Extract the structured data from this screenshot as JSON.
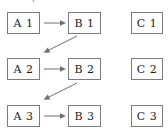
{
  "caption": {
    "text": "Example 2."
  },
  "diagram": {
    "type": "commutative-diagram",
    "style": {
      "box_border": "#7c7c7c",
      "arrow": "#6f6f6f",
      "text": "#1b1b1b",
      "background": "#ffffff"
    },
    "columns": [
      "A",
      "B",
      "C"
    ],
    "rows": [
      "1",
      "2",
      "3"
    ],
    "nodes": [
      {
        "id": "a1",
        "label": "A 1",
        "col": "A",
        "row": "1",
        "x": 7,
        "y": 12,
        "w": 33,
        "h": 22
      },
      {
        "id": "b1",
        "label": "B 1",
        "col": "B",
        "row": "1",
        "x": 68,
        "y": 12,
        "w": 33,
        "h": 22
      },
      {
        "id": "c1",
        "label": "C 1",
        "col": "C",
        "row": "1",
        "x": 131,
        "y": 12,
        "w": 32,
        "h": 22
      },
      {
        "id": "a2",
        "label": "A 2",
        "col": "A",
        "row": "2",
        "x": 7,
        "y": 58,
        "w": 33,
        "h": 22
      },
      {
        "id": "b2",
        "label": "B 2",
        "col": "B",
        "row": "2",
        "x": 68,
        "y": 58,
        "w": 33,
        "h": 22
      },
      {
        "id": "c2",
        "label": "C 2",
        "col": "C",
        "row": "2",
        "x": 131,
        "y": 58,
        "w": 32,
        "h": 22
      },
      {
        "id": "a3",
        "label": "A 3",
        "col": "A",
        "row": "3",
        "x": 7,
        "y": 105,
        "w": 33,
        "h": 22
      },
      {
        "id": "b3",
        "label": "B 3",
        "col": "B",
        "row": "3",
        "x": 68,
        "y": 105,
        "w": 33,
        "h": 22
      },
      {
        "id": "c3",
        "label": "C 3",
        "col": "C",
        "row": "3",
        "x": 131,
        "y": 105,
        "w": 32,
        "h": 22
      }
    ],
    "edges": [
      {
        "id": "e-a1-b1",
        "from": "a1",
        "to": "b1",
        "kind": "horizontal",
        "label": ""
      },
      {
        "id": "e-a2-b2",
        "from": "a2",
        "to": "b2",
        "kind": "horizontal",
        "label": ""
      },
      {
        "id": "e-a3-b3",
        "from": "a3",
        "to": "b3",
        "kind": "horizontal",
        "label": ""
      },
      {
        "id": "e-b1-a2",
        "from": "b1",
        "to": "a2",
        "kind": "diagonal",
        "label": ""
      },
      {
        "id": "e-b2-a3",
        "from": "b2",
        "to": "a3",
        "kind": "diagonal",
        "label": ""
      }
    ]
  }
}
